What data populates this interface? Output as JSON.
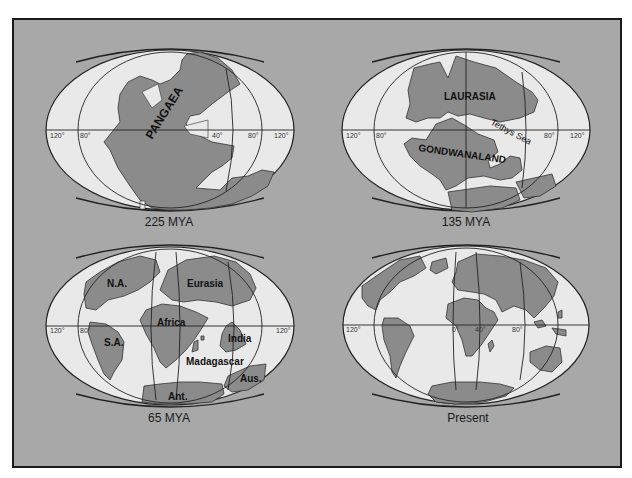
{
  "figure": {
    "panels": [
      {
        "id": "225mya",
        "caption": "225 MYA",
        "labels": [
          "PANGAEA"
        ],
        "degree_labels": [
          "120°",
          "80°",
          "40°",
          "80°",
          "120°"
        ]
      },
      {
        "id": "135mya",
        "caption": "135 MYA",
        "labels": [
          "LAURASIA",
          "GONDWANALAND",
          "Tethys Sea"
        ],
        "degree_labels": [
          "120°",
          "80°",
          "80°",
          "120°"
        ]
      },
      {
        "id": "65mya",
        "caption": "65 MYA",
        "labels": [
          "N.A.",
          "Eurasia",
          "Africa",
          "S.A.",
          "India",
          "Madagascar",
          "Aus.",
          "Ant."
        ],
        "degree_labels": [
          "120°",
          "80°",
          "120°"
        ]
      },
      {
        "id": "present",
        "caption": "Present",
        "labels": [],
        "degree_labels": [
          "120°",
          "0°",
          "40°",
          "80°"
        ]
      }
    ]
  },
  "colors": {
    "background": "#a8a8a8",
    "land": "#8b8b8b",
    "ocean": "#e9e9e9",
    "border": "#1a1a1a"
  }
}
